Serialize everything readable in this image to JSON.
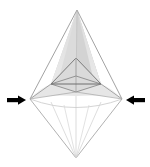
{
  "figure": {
    "title": "3D wireframe bipyramid with inward compression arrows",
    "canvas": {
      "width": 150,
      "height": 167,
      "background": "#ffffff"
    },
    "colors": {
      "background": "#ffffff",
      "upper_shade_light": "#e3e3e3",
      "upper_shade_mid": "#d6d6d6",
      "upper_shade_dark": "#cccccc",
      "flank_shade": "#e8e8e8",
      "inner_shade": "#dedede",
      "stroke_strong": "#777777",
      "stroke_mid": "#999999",
      "stroke_light": "#c4c4c4",
      "stroke_faint": "#dddddd",
      "arrow": "#000000"
    },
    "vertices": {
      "apex_top": {
        "x": 77,
        "y": 10
      },
      "left_wing": {
        "x": 30,
        "y": 99
      },
      "right_wing": {
        "x": 122,
        "y": 99
      },
      "bottom_tip": {
        "x": 76,
        "y": 158
      },
      "inner_apex": {
        "x": 76,
        "y": 58
      },
      "inner_left": {
        "x": 51,
        "y": 84
      },
      "inner_right": {
        "x": 101,
        "y": 84
      },
      "inner_front": {
        "x": 76,
        "y": 92
      },
      "inner_back": {
        "x": 76,
        "y": 76
      }
    },
    "upper_body": {
      "name": "shaded-upper-pyramid",
      "description": "Large light-gray shaded pyramid from top apex flaring down to the left and right wing vertices"
    },
    "inner_body": {
      "name": "inner-pyramid",
      "description": "Smaller inner pyramid outlined inside the upper body with visible base diamond"
    },
    "lower_body": {
      "name": "lower-cone-fan",
      "description": "Unshaded fan of straight radial lines converging from the wing vertices to the bottom tip, capped by a concave arc",
      "radial_line_count": 5
    },
    "arrows": {
      "left": {
        "label": "left-compression-arrow",
        "direction": "right",
        "tail_x": 7,
        "tip_x": 26,
        "y": 100,
        "color": "#000000"
      },
      "right": {
        "label": "right-compression-arrow",
        "direction": "left",
        "tail_x": 145,
        "tip_x": 126,
        "y": 100,
        "color": "#000000"
      }
    }
  }
}
